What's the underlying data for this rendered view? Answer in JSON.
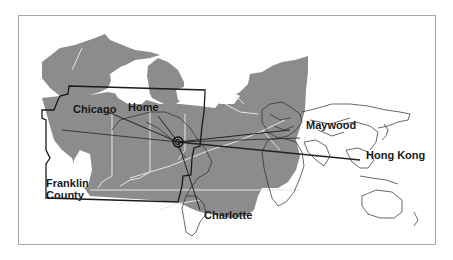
{
  "map": {
    "title": "",
    "colors": {
      "land_fill": "#8c8c8c",
      "state_border": "#e6e6e6",
      "county_outline": "#1a1a1a",
      "world_outline": "#2a2a2a",
      "route_line": "#222222",
      "frame": "#a8a8a8"
    },
    "labels": {
      "chicago": "Chicago",
      "home": "Home",
      "maywood": "Maywood",
      "hong_kong": "Hong Kong",
      "franklin_county_line1": "Franklin",
      "franklin_county_line2": "County",
      "charlotte": "Charlotte"
    },
    "hub_icon": "target-circle-icon"
  }
}
